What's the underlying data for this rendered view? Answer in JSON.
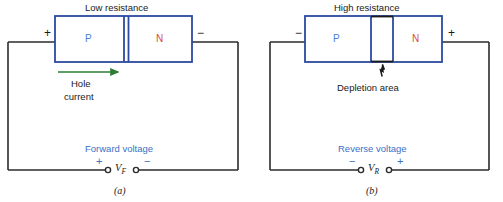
{
  "figure": {
    "panels": [
      {
        "id": "a",
        "caption": "(a)",
        "title": "Low resistance",
        "left_terminal_sign": "+",
        "right_terminal_sign": "−",
        "p_region_label": "P",
        "n_region_label": "N",
        "current_label_line1": "Hole",
        "current_label_line2": "current",
        "current_arrow_color": "#2e7d32",
        "voltage_label": "Forward voltage",
        "voltage_symbol": "V",
        "voltage_subscript": "F",
        "source_left_sign": "+",
        "source_right_sign": "−"
      },
      {
        "id": "b",
        "caption": "(b)",
        "title": "High resistance",
        "left_terminal_sign": "−",
        "right_terminal_sign": "+",
        "p_region_label": "P",
        "n_region_label": "N",
        "depletion_label": "Depletion area",
        "voltage_label": "Reverse voltage",
        "voltage_symbol": "V",
        "voltage_subscript": "R",
        "source_left_sign": "−",
        "source_right_sign": "+"
      }
    ],
    "colors": {
      "diode_outline": "#2b4aa0",
      "p_text": "#4a7fd4",
      "n_text": "#d9493f",
      "wire": "#2b2b2b",
      "voltage_text": "#3d6fc4",
      "arrow_green": "#2e7d32",
      "background": "#ffffff"
    }
  }
}
